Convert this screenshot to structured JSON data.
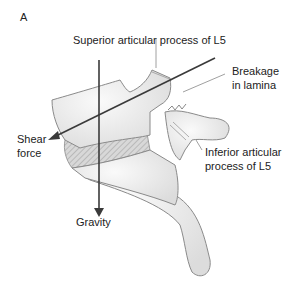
{
  "figure": {
    "panel_label": "A",
    "labels": {
      "superior": "Superior articular process of L5",
      "breakage_line1": "Breakage",
      "breakage_line2": "in lamina",
      "inferior_line1": "Inferior articular",
      "inferior_line2": "process of L5",
      "shear_line1": "Shear",
      "shear_line2": "force",
      "gravity": "Gravity"
    },
    "colors": {
      "bone_fill": "#ededed",
      "bone_stroke": "#8a8a8a",
      "arrow": "#3a3a3a",
      "disc_hatch": "#9a9a9a"
    }
  }
}
